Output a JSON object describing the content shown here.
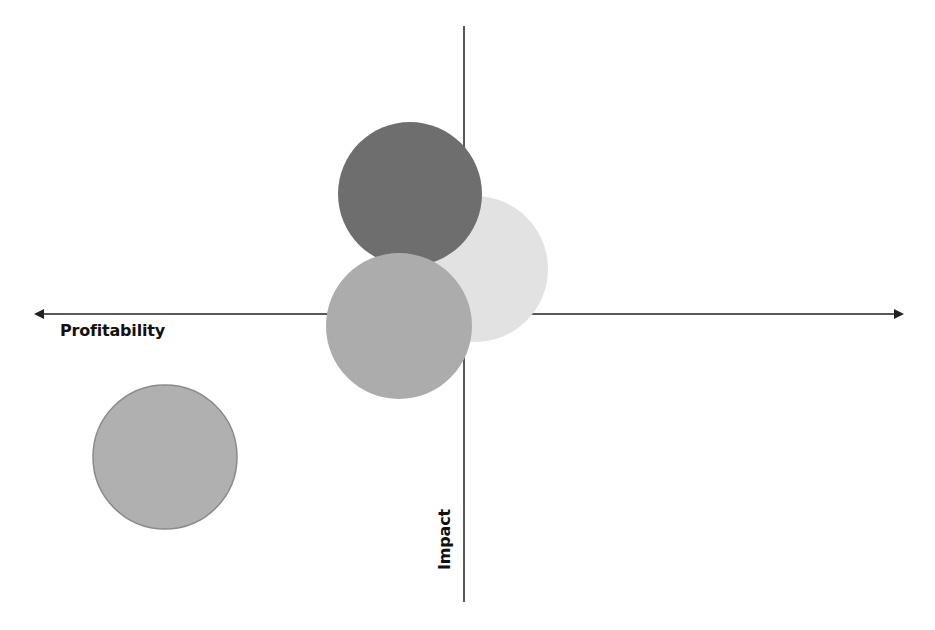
{
  "diagram": {
    "type": "quadrant-bubble-diagram",
    "x_axis": {
      "label": "Profitability",
      "y": 314,
      "x_start": 28,
      "x_end": 909,
      "arrows": [
        "left",
        "right"
      ],
      "color": "#222222"
    },
    "y_axis": {
      "label": "Impact",
      "x": 464,
      "y_start": 26,
      "y_end": 602,
      "arrows": [],
      "color": "#222222"
    },
    "bubbles": [
      {
        "id": "light-bubble",
        "cx": 475,
        "cy": 269,
        "r": 73,
        "fill": "#e2e2e2",
        "stroke": "none"
      },
      {
        "id": "dark-bubble",
        "cx": 410,
        "cy": 194,
        "r": 72,
        "fill": "#6e6e6e",
        "stroke": "none"
      },
      {
        "id": "medium-bubble",
        "cx": 399,
        "cy": 326,
        "r": 73,
        "fill": "#acacac",
        "stroke": "none"
      },
      {
        "id": "bottom-left-bubble",
        "cx": 165,
        "cy": 457,
        "r": 72,
        "fill": "#b0b0b0",
        "stroke": "#8a8a8a"
      }
    ]
  },
  "chart_data": {
    "type": "scatter",
    "title": "",
    "xlabel": "Profitability",
    "ylabel": "Impact",
    "note": "Bubble quadrant diagram with unlabeled axes; positions are relative to the axis origin (pixel offsets, +x right, +y up).",
    "origin_px": [
      464,
      314
    ],
    "series": [
      {
        "name": "dark bubble",
        "x": -54,
        "y": 120,
        "size": 72,
        "color": "#6e6e6e"
      },
      {
        "name": "light bubble",
        "x": 11,
        "y": 45,
        "size": 73,
        "color": "#e2e2e2"
      },
      {
        "name": "medium bubble",
        "x": -65,
        "y": -12,
        "size": 73,
        "color": "#acacac"
      },
      {
        "name": "bottom-left bubble",
        "x": -299,
        "y": -143,
        "size": 72,
        "color": "#b0b0b0"
      }
    ],
    "grid": false,
    "legend": null
  }
}
